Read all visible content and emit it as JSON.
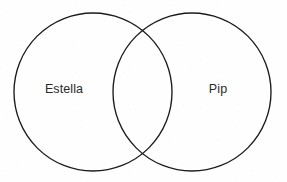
{
  "diagram": {
    "type": "venn-two-set",
    "title": "",
    "background_color": "#fefefe",
    "stroke_color": "#1b1b1b",
    "stroke_width": 1.35,
    "text_color": "#2a2a2a",
    "sets": [
      {
        "id": "left",
        "label": "Estella",
        "label_x": 64,
        "label_y": 90,
        "center_x": 93,
        "center_y": 92,
        "radius": 79
      },
      {
        "id": "right",
        "label": "Pip",
        "label_x": 218,
        "label_y": 90,
        "center_x": 192,
        "center_y": 92,
        "radius": 79
      }
    ],
    "intersection": {
      "label": "",
      "top_point_x": 143,
      "top_point_y": 25,
      "bottom_point_x": 143,
      "bottom_point_y": 158
    }
  }
}
